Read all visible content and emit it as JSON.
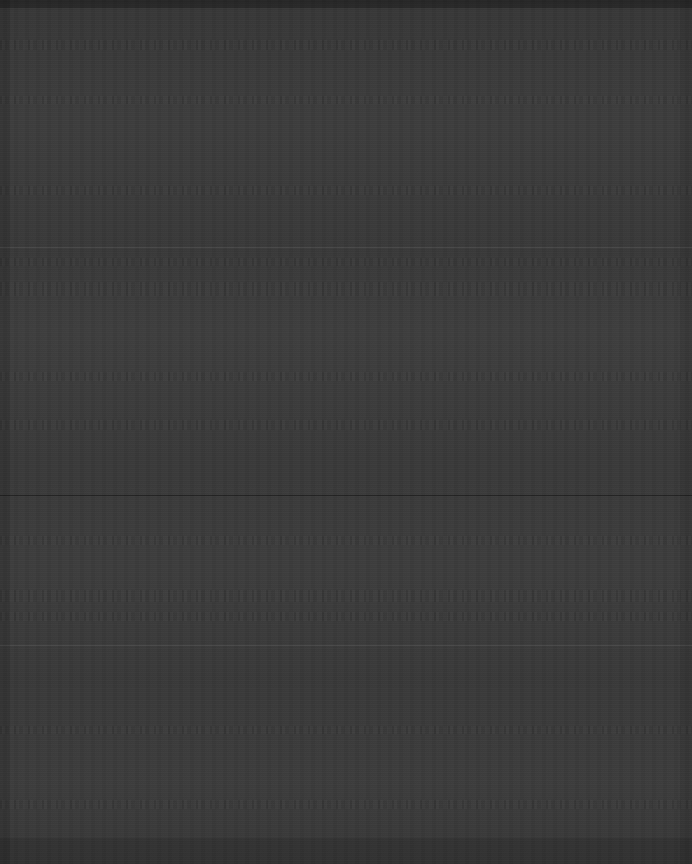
{
  "canvas": {
    "width": 692,
    "height": 864,
    "background_color": "#3a3a3a",
    "content_legible": false,
    "description": "Near-uniform dark charcoal field with horizontal compression banding; no legible text, icons or widgets resolve at any magnification."
  },
  "colors": {
    "background": "#3a3a3a",
    "page_surround": "#2e2e2e",
    "edge_shadow": "#000000",
    "separator_light": "#ffffff",
    "separator_dark": "#000000"
  },
  "chrome": {
    "top_edge": {
      "y": 0,
      "height": 8
    },
    "left_gutter": {
      "x": 0,
      "width": 10
    },
    "right_gutter": {
      "x": 680,
      "width": 12
    },
    "bottom_edge": {
      "y": 838,
      "height": 26
    }
  },
  "separators": [
    {
      "name": "separator-upper",
      "y": 247,
      "tone": "light"
    },
    {
      "name": "separator-middle",
      "y": 495,
      "tone": "dark"
    },
    {
      "name": "separator-lower",
      "y": 645,
      "tone": "light"
    }
  ],
  "ghost_bands": [
    {
      "name": "ghost-band-1",
      "y": 40,
      "height": 10
    },
    {
      "name": "ghost-band-2",
      "y": 96,
      "height": 8
    },
    {
      "name": "ghost-band-3",
      "y": 186,
      "height": 9
    },
    {
      "name": "ghost-band-4",
      "y": 258,
      "height": 8
    },
    {
      "name": "ghost-band-5",
      "y": 282,
      "height": 14
    },
    {
      "name": "ghost-band-6",
      "y": 372,
      "height": 9
    },
    {
      "name": "ghost-band-7",
      "y": 420,
      "height": 10
    },
    {
      "name": "ghost-band-8",
      "y": 536,
      "height": 9
    },
    {
      "name": "ghost-band-9",
      "y": 590,
      "height": 12
    },
    {
      "name": "ghost-band-10",
      "y": 612,
      "height": 9
    },
    {
      "name": "ghost-band-11",
      "y": 726,
      "height": 8
    },
    {
      "name": "ghost-band-12",
      "y": 800,
      "height": 9
    }
  ]
}
